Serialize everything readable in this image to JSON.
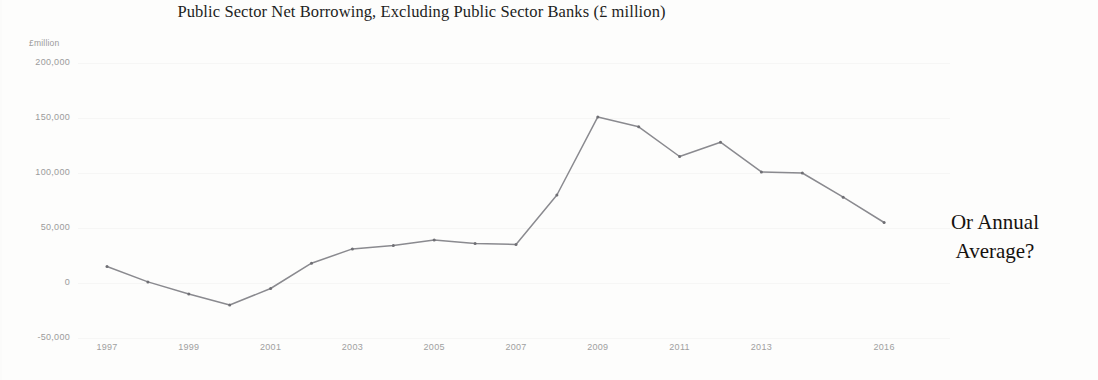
{
  "chart_data": {
    "type": "line",
    "title": "Public Sector Net Borrowing, Excluding Public Sector Banks (£ million)",
    "xlabel": "",
    "ylabel": "£million",
    "ylim": [
      -50000,
      200000
    ],
    "grid": true,
    "legend": false,
    "y_ticks": [
      "200,000",
      "150,000",
      "100,000",
      "50,000",
      "0",
      "-50,000"
    ],
    "y_tick_values": [
      200000,
      150000,
      100000,
      50000,
      0,
      -50000
    ],
    "x_ticks": [
      "1997",
      "1999",
      "2001",
      "2003",
      "2005",
      "2007",
      "2009",
      "2011",
      "2013",
      "2016"
    ],
    "x": [
      1997,
      1998,
      1999,
      2000,
      2001,
      2002,
      2003,
      2004,
      2005,
      2006,
      2007,
      2008,
      2009,
      2010,
      2011,
      2012,
      2013,
      2014,
      2015,
      2016
    ],
    "values": [
      15000,
      1000,
      -10000,
      -20000,
      -5000,
      18000,
      31000,
      34000,
      39000,
      36000,
      35000,
      80000,
      151000,
      142000,
      115000,
      128000,
      101000,
      100000,
      78000,
      55000
    ],
    "series": [
      {
        "name": "Public sector net borrowing",
        "color": "#8a8a8f",
        "values": [
          15000,
          1000,
          -10000,
          -20000,
          -5000,
          18000,
          31000,
          34000,
          39000,
          36000,
          35000,
          80000,
          151000,
          142000,
          115000,
          128000,
          101000,
          100000,
          78000,
          55000
        ]
      }
    ],
    "annotations": [
      {
        "text_line_1": "Or Annual",
        "text_line_2": "Average?"
      }
    ]
  },
  "annotation": {
    "line1": "Or Annual",
    "line2": "Average?"
  },
  "colors": {
    "line": "#8a8a8f",
    "marker": "#6f6f74",
    "tick_text": "#9b9b9b",
    "title_text": "#1d1d1d",
    "background": "#fdfdfc"
  }
}
